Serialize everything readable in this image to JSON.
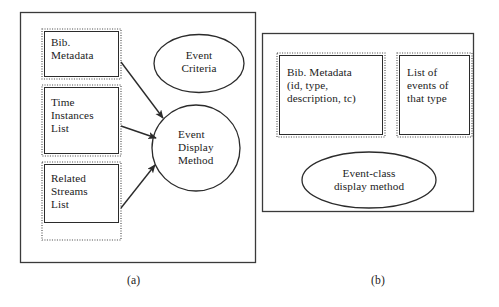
{
  "figure": {
    "panels": [
      {
        "id": "panel-a",
        "caption": "(a)",
        "boxes": [
          {
            "id": "bib-metadata",
            "lines": "Bib.\nMetadata"
          },
          {
            "id": "time-instances-list",
            "lines": "Time\nInstances\nList"
          },
          {
            "id": "related-streams-list",
            "lines": "Related\nStreams\nList"
          }
        ],
        "ellipses": [
          {
            "id": "event-criteria",
            "lines": "Event\nCriteria"
          },
          {
            "id": "event-display-method",
            "lines": "Event\nDisplay\nMethod"
          }
        ],
        "arrows": [
          {
            "id": "arrow-bib-metadata-to-event-display-method",
            "from": "bib-metadata",
            "to": "event-display-method"
          },
          {
            "id": "arrow-time-instances-to-event-display-method",
            "from": "time-instances-list",
            "to": "event-display-method"
          },
          {
            "id": "arrow-related-streams-to-event-display-method",
            "from": "related-streams-list",
            "to": "event-display-method"
          }
        ]
      },
      {
        "id": "panel-b",
        "caption": "(b)",
        "boxes": [
          {
            "id": "bib-metadata-detail",
            "lines": "Bib. Metadata\n(id, type,\ndescription, tc)"
          },
          {
            "id": "list-of-events",
            "lines": "List of\nevents of\nthat type"
          }
        ],
        "ellipses": [
          {
            "id": "event-class-display-method",
            "lines": "Event-class\ndisplay method"
          }
        ],
        "arrows": []
      }
    ],
    "style": {
      "background": "#ffffff",
      "stroke": "#2b2b2b",
      "box_border": "dotted",
      "frame_border": "solid",
      "text_color": "#1b1b1b"
    }
  }
}
